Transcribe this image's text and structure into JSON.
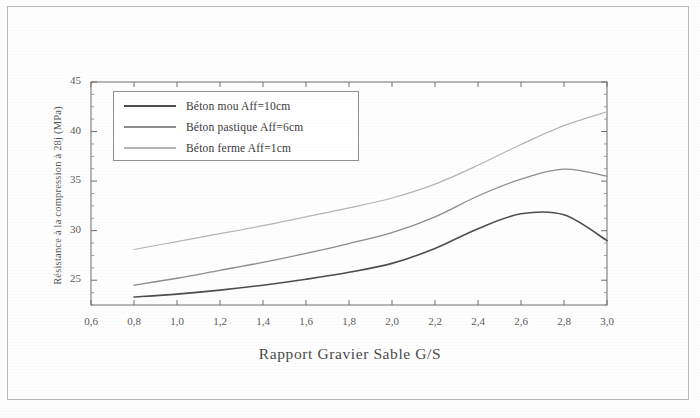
{
  "chart_data": {
    "type": "line",
    "title": "",
    "xlabel": "Rapport Gravier Sable G/S",
    "ylabel": "Résistance à la compression à 28j (MPa)",
    "xlim": [
      0.6,
      3.0
    ],
    "ylim": [
      22.5,
      45.0
    ],
    "xticks": [
      "0,6",
      "0,8",
      "1,0",
      "1,2",
      "1,4",
      "1,6",
      "1,8",
      "2,0",
      "2,2",
      "2,4",
      "2,6",
      "2,8",
      "3,0"
    ],
    "xtick_values": [
      0.6,
      0.8,
      1.0,
      1.2,
      1.4,
      1.6,
      1.8,
      2.0,
      2.2,
      2.4,
      2.6,
      2.8,
      3.0
    ],
    "yticks": [
      "25",
      "30",
      "35",
      "40",
      "45"
    ],
    "ytick_values": [
      25,
      30,
      35,
      40,
      45
    ],
    "grid": false,
    "legend_position": "upper-left",
    "x": [
      0.8,
      1.0,
      1.2,
      1.4,
      1.6,
      1.8,
      2.0,
      2.2,
      2.4,
      2.6,
      2.8,
      3.0
    ],
    "series": [
      {
        "name": "Béton mou Aff=10cm",
        "color": "#4d4d4d",
        "width": 1.6,
        "values": [
          23.3,
          23.6,
          24.0,
          24.5,
          25.1,
          25.8,
          26.7,
          28.2,
          30.2,
          31.7,
          31.6,
          29.0
        ]
      },
      {
        "name": "Béton pastique Aff=6cm",
        "color": "#8c8c8c",
        "width": 1.3,
        "values": [
          24.5,
          25.2,
          26.0,
          26.8,
          27.7,
          28.7,
          29.8,
          31.4,
          33.5,
          35.2,
          36.2,
          35.5
        ]
      },
      {
        "name": "Béton ferme Aff=1cm",
        "color": "#b5b5b5",
        "width": 1.2,
        "values": [
          28.1,
          28.9,
          29.7,
          30.5,
          31.4,
          32.3,
          33.3,
          34.7,
          36.6,
          38.7,
          40.6,
          42.0
        ]
      }
    ]
  },
  "legend": {
    "items": [
      {
        "label": "Béton mou Aff=10cm"
      },
      {
        "label": "Béton pastique Aff=6cm"
      },
      {
        "label": "Béton ferme Aff=1cm"
      }
    ]
  }
}
